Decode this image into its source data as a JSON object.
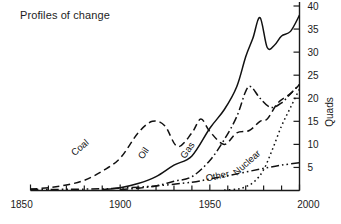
{
  "chart_data": {
    "type": "line",
    "title": "Profiles of change",
    "xlabel": "",
    "ylabel": "Quads",
    "xlim": [
      1850,
      2000
    ],
    "ylim": [
      0,
      40
    ],
    "xticks": [
      1850,
      1900,
      1950,
      2000
    ],
    "xtick_labels": [
      "1850",
      "1900",
      "1950",
      "2000"
    ],
    "x_minor_step": 10,
    "yticks": [
      5,
      10,
      15,
      20,
      25,
      30,
      35,
      40
    ],
    "ytick_labels": [
      "5",
      "10",
      "15",
      "20",
      "25",
      "30",
      "35",
      "40"
    ],
    "y_axis_side": "right",
    "grid": false,
    "legend": "inline-curve-labels",
    "series": [
      {
        "name": "Coal",
        "label": "Coal",
        "style": "dashed",
        "x": [
          1850,
          1860,
          1870,
          1880,
          1890,
          1900,
          1910,
          1918,
          1925,
          1932,
          1940,
          1945,
          1950,
          1958,
          1965,
          1972,
          1978,
          1982,
          1988,
          1995,
          2000
        ],
        "y": [
          0.3,
          0.6,
          1.2,
          2.2,
          4.2,
          7.0,
          12.5,
          15.0,
          14.0,
          9.5,
          12.5,
          15.5,
          12.8,
          10.0,
          12.5,
          13.0,
          15.0,
          15.5,
          19.0,
          21.0,
          23.0
        ]
      },
      {
        "name": "Oil",
        "label": "Oil",
        "style": "solid",
        "x": [
          1890,
          1900,
          1910,
          1920,
          1930,
          1940,
          1950,
          1958,
          1965,
          1970,
          1974,
          1978,
          1982,
          1986,
          1990,
          1995,
          2000
        ],
        "y": [
          0.2,
          0.6,
          1.5,
          3.0,
          5.5,
          7.5,
          13.5,
          17.5,
          22.5,
          29.0,
          33.0,
          37.5,
          31.0,
          31.5,
          33.5,
          34.5,
          38.0
        ]
      },
      {
        "name": "Gas",
        "label": "Gas",
        "style": "dash-dot",
        "x": [
          1900,
          1910,
          1920,
          1930,
          1940,
          1950,
          1958,
          1965,
          1970,
          1973,
          1978,
          1984,
          1990,
          1995,
          2000
        ],
        "y": [
          0.2,
          0.5,
          1.0,
          2.0,
          3.0,
          6.5,
          11.0,
          16.0,
          21.5,
          22.5,
          20.0,
          18.0,
          19.0,
          21.0,
          23.0
        ]
      },
      {
        "name": "Nuclear",
        "label": "Nuclear",
        "style": "dotted",
        "x": [
          1958,
          1965,
          1970,
          1975,
          1980,
          1985,
          1990,
          1995,
          2000
        ],
        "y": [
          0.1,
          0.3,
          0.8,
          2.0,
          4.5,
          9.0,
          14.0,
          18.0,
          22.0
        ]
      },
      {
        "name": "Other",
        "label": "Other",
        "style": "dash-dot-dot",
        "x": [
          1850,
          1880,
          1900,
          1920,
          1940,
          1950,
          1960,
          1970,
          1980,
          1990,
          2000
        ],
        "y": [
          0.2,
          0.3,
          0.5,
          1.0,
          1.8,
          2.5,
          3.2,
          4.0,
          4.8,
          5.5,
          6.0
        ]
      }
    ],
    "series_label_positions": [
      {
        "name": "Coal",
        "x_px": 82,
        "y_px": 150,
        "rotate": -40
      },
      {
        "name": "Oil",
        "x_px": 146,
        "y_px": 155,
        "rotate": -55
      },
      {
        "name": "Gas",
        "x_px": 190,
        "y_px": 152,
        "rotate": -55
      },
      {
        "name": "Nuclear",
        "x_px": 249,
        "y_px": 165,
        "rotate": -42
      },
      {
        "name": "Other",
        "x_px": 218,
        "y_px": 179,
        "rotate": -12
      }
    ],
    "colors": {
      "line": "#111111",
      "axis": "#1a1a1a",
      "background": "#ffffff",
      "text": "#1a1a1a"
    }
  }
}
